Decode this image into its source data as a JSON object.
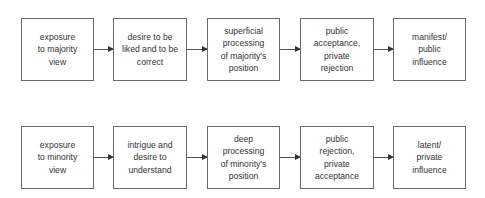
{
  "rows": [
    {
      "name": "majority",
      "boxes": [
        {
          "label": "exposure\nto majority\nview"
        },
        {
          "label": "desire to be\nliked and to be\ncorrect"
        },
        {
          "label": "superficial\nprocessing\nof majority's\nposition"
        },
        {
          "label": "public\nacceptance,\nprivate\nrejection"
        },
        {
          "label": "manifest/\npublic\ninfluence"
        }
      ]
    },
    {
      "name": "minority",
      "boxes": [
        {
          "label": "exposure\nto minority\nview"
        },
        {
          "label": "intrigue and\ndesire to\nunderstand"
        },
        {
          "label": "deep\nprocessing\nof minority's\nposition"
        },
        {
          "label": "public\nrejection,\nprivate\nacceptance"
        },
        {
          "label": "latent/\nprivate\ninfluence"
        }
      ]
    }
  ],
  "colors": {
    "border": "#6a6a6a",
    "text": "#333333",
    "arrow": "#333333"
  }
}
